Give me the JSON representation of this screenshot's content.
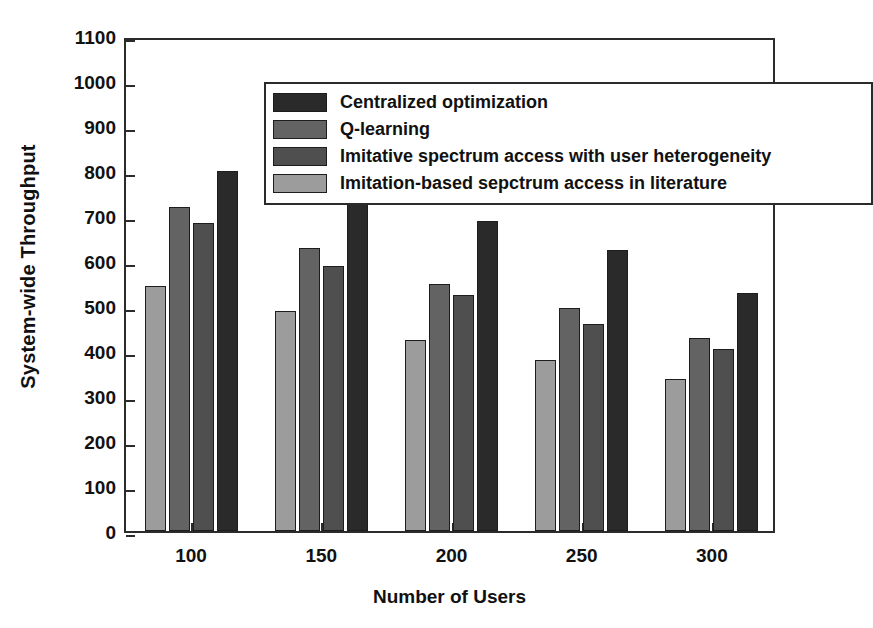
{
  "chart_data": {
    "type": "bar",
    "title": "",
    "xlabel": "Number of Users",
    "ylabel": "System-wide Throughput",
    "categories": [
      "100",
      "150",
      "200",
      "250",
      "300"
    ],
    "ylim": [
      0,
      1100
    ],
    "yticks": [
      0,
      100,
      200,
      300,
      400,
      500,
      600,
      700,
      800,
      900,
      1000,
      1100
    ],
    "ytick_labels": [
      "0",
      "100",
      "200",
      "300",
      "400",
      "500",
      "600",
      "700",
      "800",
      "900",
      "1000",
      "1100"
    ],
    "grid": false,
    "legend_position": "upper-left-inside",
    "series": [
      {
        "name": "Imitation-based sepctrum access in literature",
        "color": "#9c9c9c",
        "draw_order": 0,
        "values": [
          545,
          490,
          425,
          380,
          338
        ]
      },
      {
        "name": "Q-learning",
        "color": "#636363",
        "draw_order": 1,
        "values": [
          720,
          630,
          550,
          495,
          430
        ]
      },
      {
        "name": "Imitative spectrum access with user heterogeneity",
        "color": "#4f4f4f",
        "draw_order": 2,
        "values": [
          685,
          590,
          525,
          460,
          405
        ]
      },
      {
        "name": "Centralized optimization",
        "color": "#2a2a2a",
        "draw_order": 3,
        "values": [
          800,
          742,
          688,
          625,
          528
        ]
      }
    ],
    "legend_order": [
      "Centralized optimization",
      "Q-learning",
      "Imitative spectrum access with user heterogeneity",
      "Imitation-based sepctrum access in literature"
    ],
    "legend_colors": [
      "#2a2a2a",
      "#636363",
      "#4f4f4f",
      "#9c9c9c"
    ]
  },
  "axes": {
    "frame_color": "#2b2b2b"
  }
}
